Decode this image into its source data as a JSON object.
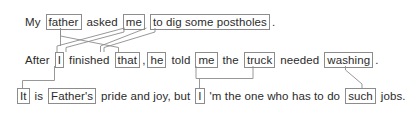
{
  "diagram": {
    "type": "coreference-annotation",
    "box_border_color": "#8c8c8c",
    "link_color": "#8c8c8c",
    "text_color": "#2b2b2b",
    "background_color": "#ffffff",
    "lines": [
      {
        "id": "line-1",
        "text": "My father asked me to dig some postholes.",
        "tokens": [
          {
            "text": "My",
            "boxed": false
          },
          {
            "text": "father",
            "boxed": true
          },
          {
            "text": "asked",
            "boxed": false
          },
          {
            "text": "me",
            "boxed": true
          },
          {
            "text": "to dig some postholes",
            "boxed": true
          },
          {
            "text": ".",
            "boxed": false
          }
        ]
      },
      {
        "id": "line-2",
        "text": "After I finished that, he told me the truck needed washing.",
        "tokens": [
          {
            "text": "After",
            "boxed": false
          },
          {
            "text": "I",
            "boxed": true
          },
          {
            "text": "finished",
            "boxed": false
          },
          {
            "text": "that",
            "boxed": true
          },
          {
            "text": ",",
            "boxed": false
          },
          {
            "text": "he",
            "boxed": true
          },
          {
            "text": "told",
            "boxed": false
          },
          {
            "text": "me",
            "boxed": true
          },
          {
            "text": "the",
            "boxed": false
          },
          {
            "text": "truck",
            "boxed": true
          },
          {
            "text": "needed",
            "boxed": false
          },
          {
            "text": "washing",
            "boxed": true
          },
          {
            "text": ".",
            "boxed": false
          }
        ]
      },
      {
        "id": "line-3",
        "text": "It is Father's pride and joy, but I 'm the one who has to do such jobs.",
        "tokens": [
          {
            "text": "It",
            "boxed": true
          },
          {
            "text": "is",
            "boxed": false
          },
          {
            "text": "Father's",
            "boxed": true
          },
          {
            "text": "pride and joy, but",
            "boxed": false
          },
          {
            "text": "I",
            "boxed": true
          },
          {
            "text": "'m the one who has to do",
            "boxed": false
          },
          {
            "text": "such",
            "boxed": true
          },
          {
            "text": "jobs.",
            "boxed": false
          }
        ]
      }
    ],
    "links": [
      {
        "from": "father",
        "to": "he",
        "kind": "coreference"
      },
      {
        "from": "me",
        "to": "I",
        "kind": "coreference"
      },
      {
        "from": "to dig some postholes",
        "to": "that",
        "kind": "coreference"
      },
      {
        "from": "me",
        "to": "I-line3",
        "kind": "coreference"
      },
      {
        "from": "truck",
        "to": "I-line3",
        "kind": "coreference"
      },
      {
        "from": "I-line2",
        "to": "It",
        "kind": "coreference"
      },
      {
        "from": "washing",
        "to": "such",
        "kind": "coreference"
      }
    ]
  }
}
